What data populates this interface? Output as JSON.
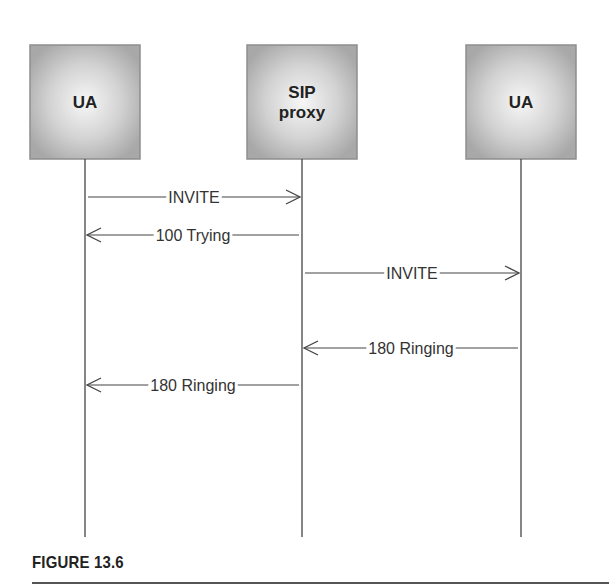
{
  "participants": [
    {
      "id": "ua-left",
      "lines": [
        "UA"
      ]
    },
    {
      "id": "sip-proxy",
      "lines": [
        "SIP",
        "proxy"
      ]
    },
    {
      "id": "ua-right",
      "lines": [
        "UA"
      ]
    }
  ],
  "messages": [
    {
      "from": 0,
      "to": 1,
      "label": "INVITE"
    },
    {
      "from": 1,
      "to": 0,
      "label": "100 Trying"
    },
    {
      "from": 1,
      "to": 2,
      "label": "INVITE"
    },
    {
      "from": 2,
      "to": 1,
      "label": "180 Ringing"
    },
    {
      "from": 1,
      "to": 0,
      "label": "180 Ringing"
    }
  ],
  "caption": "FIGURE 13.6",
  "colors": {
    "box_edge": "#9a9a9a",
    "box_center": "#f4f4f4",
    "line": "#444444",
    "text": "#222222"
  }
}
